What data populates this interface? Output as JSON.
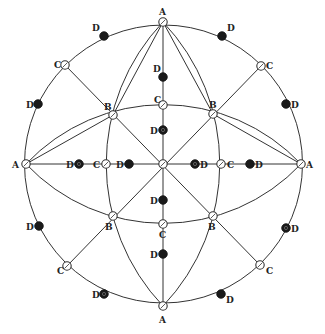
{
  "diagram": {
    "center": {
      "x": 163,
      "y": 164
    },
    "outer_circle_radius": 139,
    "colors": {
      "stroke": "#333333",
      "filled_point": "#1a1a1a",
      "background": "#ffffff"
    },
    "points": [
      {
        "id": "A-top",
        "label": "A",
        "x": 163,
        "y": 22,
        "style": "ring",
        "lx": 159,
        "ly": 15
      },
      {
        "id": "A-bottom",
        "label": "A",
        "x": 163,
        "y": 306,
        "style": "ring",
        "lx": 159,
        "ly": 323
      },
      {
        "id": "A-left",
        "label": "A",
        "x": 26,
        "y": 164,
        "style": "ring",
        "lx": 12,
        "ly": 168
      },
      {
        "id": "A-right",
        "label": "A",
        "x": 301,
        "y": 164,
        "style": "ring",
        "lx": 306,
        "ly": 168
      },
      {
        "id": "A-center",
        "label": "",
        "x": 163,
        "y": 164,
        "style": "ring"
      },
      {
        "id": "B-ul",
        "label": "B",
        "x": 113,
        "y": 115,
        "style": "ring",
        "lx": 104,
        "ly": 110
      },
      {
        "id": "B-ur",
        "label": "B",
        "x": 213,
        "y": 114,
        "style": "ring",
        "lx": 209,
        "ly": 108
      },
      {
        "id": "B-ll",
        "label": "B",
        "x": 113,
        "y": 216,
        "style": "ring",
        "lx": 105,
        "ly": 230
      },
      {
        "id": "B-lr",
        "label": "B",
        "x": 213,
        "y": 216,
        "style": "ring",
        "lx": 208,
        "ly": 230
      },
      {
        "id": "C-ul",
        "label": "C",
        "x": 65,
        "y": 65,
        "style": "ring",
        "lx": 54,
        "ly": 68
      },
      {
        "id": "C-ur",
        "label": "C",
        "x": 261,
        "y": 66,
        "style": "ring",
        "lx": 266,
        "ly": 69
      },
      {
        "id": "C-ll",
        "label": "C",
        "x": 67,
        "y": 266,
        "style": "ring",
        "lx": 57,
        "ly": 274
      },
      {
        "id": "C-lr",
        "label": "C",
        "x": 260,
        "y": 265,
        "style": "ring",
        "lx": 266,
        "ly": 274
      },
      {
        "id": "C-top",
        "label": "C",
        "x": 163,
        "y": 105,
        "style": "ring",
        "lx": 154,
        "ly": 103
      },
      {
        "id": "C-bottom",
        "label": "C",
        "x": 163,
        "y": 224,
        "style": "ring",
        "lx": 159,
        "ly": 238
      },
      {
        "id": "C-left",
        "label": "C",
        "x": 106,
        "y": 164,
        "style": "ring",
        "lx": 93,
        "ly": 168
      },
      {
        "id": "C-right",
        "label": "C",
        "x": 221,
        "y": 164,
        "style": "ring",
        "lx": 227,
        "ly": 168
      },
      {
        "id": "D-outer-1",
        "label": "D",
        "x": 104,
        "y": 36,
        "style": "filled",
        "lx": 92,
        "ly": 31
      },
      {
        "id": "D-outer-2",
        "label": "D",
        "x": 222,
        "y": 36,
        "style": "filled",
        "lx": 227,
        "ly": 31
      },
      {
        "id": "D-outer-3",
        "label": "D",
        "x": 38,
        "y": 104,
        "style": "filled",
        "lx": 26,
        "ly": 108
      },
      {
        "id": "D-outer-4",
        "label": "D",
        "x": 286,
        "y": 104,
        "style": "filled",
        "lx": 291,
        "ly": 108
      },
      {
        "id": "D-outer-5",
        "label": "D",
        "x": 39,
        "y": 226,
        "style": "filled",
        "lx": 26,
        "ly": 230
      },
      {
        "id": "D-outer-6",
        "label": "D",
        "x": 286,
        "y": 228,
        "style": "filled-hatched",
        "lx": 291,
        "ly": 232
      },
      {
        "id": "D-outer-7",
        "label": "D",
        "x": 104,
        "y": 294,
        "style": "filled-hatched",
        "lx": 92,
        "ly": 298
      },
      {
        "id": "D-outer-8",
        "label": "D",
        "x": 221,
        "y": 294,
        "style": "filled",
        "lx": 226,
        "ly": 303
      },
      {
        "id": "D-inner-top-1",
        "label": "D",
        "x": 163,
        "y": 77,
        "style": "filled",
        "lx": 153,
        "ly": 72
      },
      {
        "id": "D-inner-top-2",
        "label": "D",
        "x": 163,
        "y": 130,
        "style": "filled-hatched",
        "lx": 150,
        "ly": 134
      },
      {
        "id": "D-inner-bottom-1",
        "label": "D",
        "x": 163,
        "y": 200,
        "style": "filled",
        "lx": 150,
        "ly": 204
      },
      {
        "id": "D-inner-bottom-2",
        "label": "D",
        "x": 163,
        "y": 254,
        "style": "filled",
        "lx": 150,
        "ly": 258
      },
      {
        "id": "D-inner-left-1",
        "label": "D",
        "x": 79,
        "y": 164,
        "style": "filled-hatched",
        "lx": 66,
        "ly": 168
      },
      {
        "id": "D-inner-left-2",
        "label": "D",
        "x": 129,
        "y": 164,
        "style": "filled",
        "lx": 116,
        "ly": 168
      },
      {
        "id": "D-inner-right-1",
        "label": "D",
        "x": 195,
        "y": 164,
        "style": "filled-hatched",
        "lx": 200,
        "ly": 168
      },
      {
        "id": "D-inner-right-2",
        "label": "D",
        "x": 250,
        "y": 164,
        "style": "filled",
        "lx": 255,
        "ly": 168
      }
    ]
  }
}
